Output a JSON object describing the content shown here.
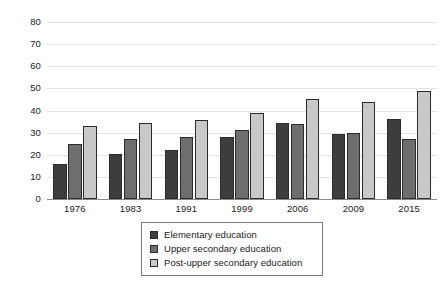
{
  "chart_data": {
    "type": "bar",
    "title": "",
    "subtitle": "",
    "xlabel": "",
    "ylabel": "",
    "categories": [
      "1976",
      "1983",
      "1991",
      "1999",
      "2006",
      "2009",
      "2015"
    ],
    "series": [
      {
        "name": "Elementary education",
        "color": "#3d3d3d",
        "values": [
          16,
          20.5,
          22,
          28,
          34.5,
          29.5,
          36
        ]
      },
      {
        "name": "Upper secondary education",
        "color": "#6e6e6e",
        "values": [
          25,
          27,
          28,
          31,
          34,
          30,
          27
        ]
      },
      {
        "name": "Post-upper secondary education",
        "color": "#c8c8c8",
        "values": [
          33,
          34.5,
          35.5,
          39,
          45,
          44,
          49
        ]
      }
    ],
    "ylim": [
      0,
      80
    ],
    "ytick_step": 10,
    "yticks": [
      "80",
      "70",
      "60",
      "50",
      "40",
      "30",
      "20",
      "10",
      "0"
    ],
    "grid": true,
    "grid_axis": "y",
    "legend_position": "bottom-center",
    "annotations": []
  },
  "legend": {
    "items": [
      {
        "label": "Elementary education"
      },
      {
        "label": "Upper secondary education"
      },
      {
        "label": "Post-upper secondary education"
      }
    ]
  }
}
